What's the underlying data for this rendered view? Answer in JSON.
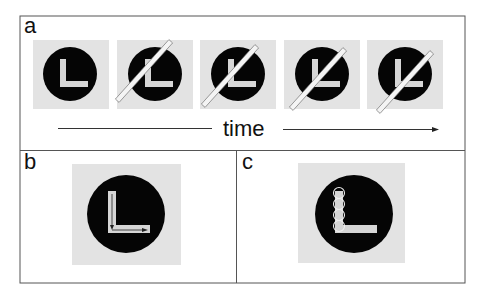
{
  "figure": {
    "colors": {
      "frame": "#555555",
      "background_square": "#e3e3e3",
      "disk": "#050505",
      "letter": "#d6d6d6",
      "bar_fill": "#f4f4f4",
      "bar_stroke": "#666666",
      "arrow": "#222222"
    }
  },
  "panels": {
    "a": {
      "label": "a",
      "axis_label": "time",
      "frames": [
        {
          "name": "frame-1",
          "bar": false
        },
        {
          "name": "frame-2",
          "bar": true
        },
        {
          "name": "frame-3",
          "bar": true
        },
        {
          "name": "frame-4",
          "bar": true
        },
        {
          "name": "frame-5",
          "bar": true
        }
      ]
    },
    "b": {
      "label": "b",
      "description": "L stimulus with arrows tracing vertical then horizontal stroke"
    },
    "c": {
      "label": "c",
      "description": "L stimulus with four outlined circles along vertical stroke"
    }
  }
}
